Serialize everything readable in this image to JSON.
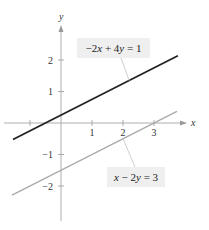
{
  "chart_data": {
    "type": "line",
    "title": "",
    "xlabel": "x",
    "ylabel": "y",
    "xlim": [
      -1.6,
      4.0
    ],
    "ylim": [
      -3.1,
      3.0
    ],
    "grid": false,
    "x_ticks": [
      -1,
      1,
      2,
      3
    ],
    "x_tick_labels": [
      "",
      "1",
      "2",
      "3"
    ],
    "y_ticks": [
      2,
      1,
      -1,
      -2
    ],
    "y_tick_labels": [
      "2",
      "1",
      "−1",
      "−2"
    ],
    "series": [
      {
        "name": "−2x + 4y = 1",
        "equation": "-2x + 4y = 1",
        "slope": 0.5,
        "intercept": 0.25,
        "x_range": [
          -1.55,
          3.77
        ],
        "color": "#222222",
        "label_anchor_x": 2.2
      },
      {
        "name": "x − 2y = 3",
        "equation": "x - 2y = 3",
        "slope": 0.5,
        "intercept": -1.5,
        "x_range": [
          -1.58,
          3.74
        ],
        "color": "#aaaaaa",
        "label_anchor_x": 2.0
      }
    ],
    "annotations": [
      {
        "text_parts": [
          "−2",
          "x",
          " + 4",
          "y",
          " = 1"
        ],
        "series": 0
      },
      {
        "text_parts": [
          "x",
          " − 2",
          "y",
          " = 3"
        ],
        "series": 1
      }
    ]
  },
  "colors": {
    "axis": "#9a9a9a",
    "label_box": "#efefef",
    "leader": "#cfcfcf"
  }
}
